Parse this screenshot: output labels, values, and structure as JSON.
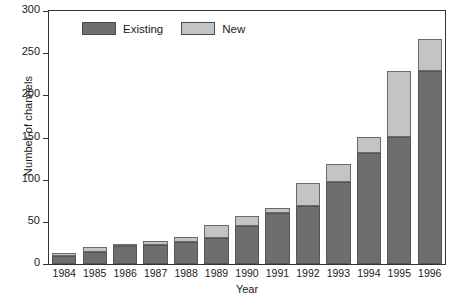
{
  "chart_data": {
    "type": "bar",
    "title": "",
    "subtitle": "",
    "xlabel": "Year",
    "ylabel": "Number of channels",
    "categories": [
      "1984",
      "1985",
      "1986",
      "1987",
      "1988",
      "1989",
      "1990",
      "1991",
      "1992",
      "1993",
      "1994",
      "1995",
      "1996"
    ],
    "series": [
      {
        "name": "Existing",
        "color": "#6e6e6e",
        "values": [
          10,
          14,
          21,
          22,
          26,
          31,
          45,
          60,
          69,
          97,
          132,
          151,
          229
        ]
      },
      {
        "name": "New",
        "color": "#c4c4c4",
        "values": [
          3,
          6,
          2,
          5,
          6,
          15,
          12,
          7,
          27,
          22,
          19,
          78,
          38
        ]
      }
    ],
    "totals": [
      13,
      20,
      23,
      27,
      32,
      46,
      57,
      67,
      96,
      119,
      151,
      229,
      267
    ],
    "stacked": true,
    "ylim": [
      0,
      300
    ],
    "yticks": [
      0,
      50,
      100,
      150,
      200,
      250,
      300
    ],
    "ytick_labels": [
      "0",
      "50",
      "100",
      "150",
      "200",
      "250",
      "300"
    ],
    "grid": false,
    "legend_position": "top-left-inside"
  },
  "legend": {
    "items": [
      {
        "label": "Existing",
        "color": "#6e6e6e"
      },
      {
        "label": "New",
        "color": "#c4c4c4"
      }
    ]
  },
  "axes": {
    "y_title": "Number of channels",
    "x_title": "Year"
  }
}
